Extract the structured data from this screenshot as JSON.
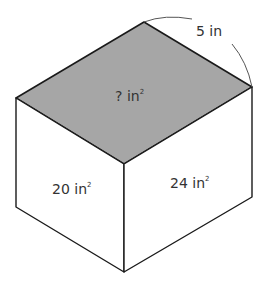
{
  "diagram": {
    "colors": {
      "top_face": "#a6a6a6",
      "side_faces": "#ffffff",
      "edges": "#1a1a1a",
      "dimension_arc": "#555555",
      "text": "#333333"
    },
    "labels": {
      "top_face": "? in",
      "top_face_sup": "2",
      "left_face": "20 in",
      "left_face_sup": "2",
      "right_face": "24 in",
      "right_face_sup": "2",
      "edge_dimension": "5 in"
    }
  }
}
